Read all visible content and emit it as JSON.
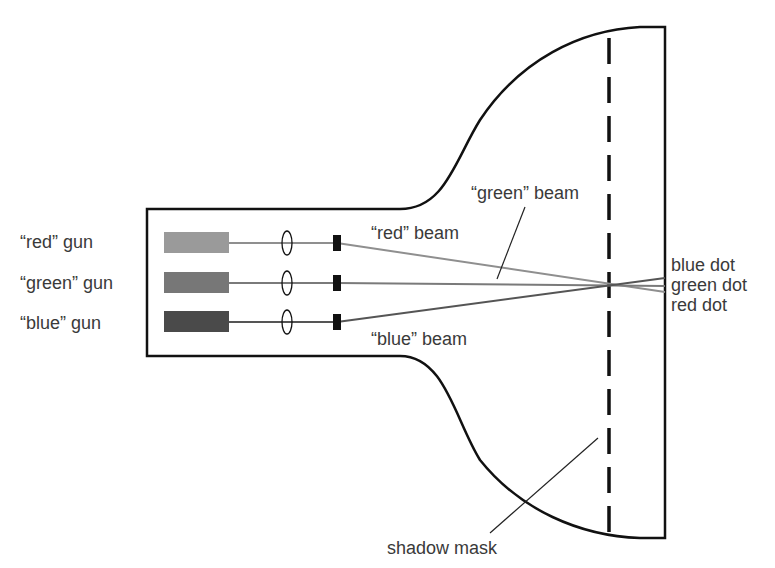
{
  "diagram": {
    "colors": {
      "outline": "#111111",
      "red_gun": "#9a9a9a",
      "green_gun": "#777777",
      "blue_gun": "#4a4a4a",
      "red_beam": "#8f8f8f",
      "green_beam": "#7a7a7a",
      "blue_beam": "#555555",
      "label_text": "#3a3a3a"
    },
    "guns": [
      {
        "id": "red",
        "label": "“red” gun"
      },
      {
        "id": "green",
        "label": "“green” gun"
      },
      {
        "id": "blue",
        "label": "“blue” gun"
      }
    ],
    "beams": [
      {
        "id": "red",
        "label": "“red” beam"
      },
      {
        "id": "green",
        "label": "“green” beam"
      },
      {
        "id": "blue",
        "label": "“blue” beam"
      }
    ],
    "dots": [
      {
        "id": "blue",
        "label": "blue dot"
      },
      {
        "id": "green",
        "label": "green dot"
      },
      {
        "id": "red",
        "label": "red dot"
      }
    ],
    "shadow_mask_label": "shadow mask"
  }
}
